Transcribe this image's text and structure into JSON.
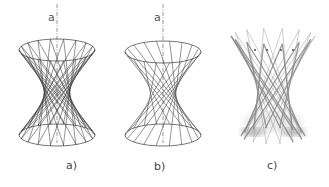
{
  "figures": [
    {
      "id": "a",
      "caption": "a)",
      "axis_label": "a",
      "style": "wireframe",
      "twist": "symmetric",
      "cx": 57,
      "top_y": 50,
      "bottom_y": 135,
      "waist_y": 92,
      "rx": 38,
      "ry": 11,
      "waist_rx": 14,
      "rulings": 18,
      "axis_label_pos": [
        48,
        12
      ],
      "caption_pos": [
        66,
        160
      ]
    },
    {
      "id": "b",
      "caption": "b)",
      "axis_label": "a",
      "style": "wireframe",
      "twist": "single",
      "cx": 163,
      "top_y": 52,
      "bottom_y": 135,
      "waist_y": 93,
      "rx": 38,
      "ry": 11,
      "waist_rx": 14,
      "rulings": 18,
      "axis_label_pos": [
        154,
        12
      ],
      "caption_pos": [
        154,
        161
      ]
    },
    {
      "id": "c",
      "caption": "c)",
      "style": "rendered-stick-model",
      "cx": 273,
      "top_y": 40,
      "bottom_y": 130,
      "waist_y": 95,
      "rx": 38,
      "ry": 8,
      "waist_rx": 14,
      "rulings": 14,
      "caption_pos": [
        267,
        160
      ]
    }
  ],
  "colors": {
    "line": "#3a3a3a",
    "axis": "#555555",
    "stick": "#8a8a8a",
    "shadow": "#6f6f6f",
    "text": "#444444"
  }
}
